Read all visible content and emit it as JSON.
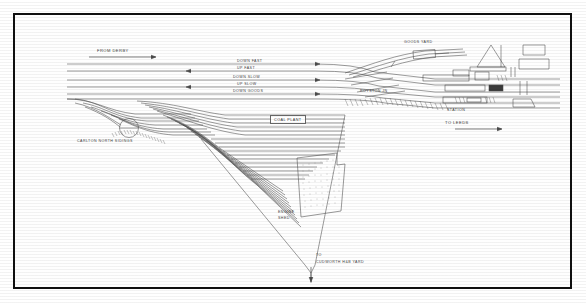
{
  "diagram": {
    "frame_color": "#101010",
    "ink_color": "#4a4a4a",
    "paper_color": "#fefefe"
  },
  "main_lines": [
    {
      "id": "down-fast",
      "label": "DOWN FAST",
      "direction": "right",
      "y": 62
    },
    {
      "id": "up-fast",
      "label": "UP FAST",
      "direction": "left",
      "y": 69
    },
    {
      "id": "down-slow",
      "label": "DOWN SLOW",
      "direction": "right",
      "y": 78
    },
    {
      "id": "up-slow",
      "label": "UP SLOW",
      "direction": "left",
      "y": 85
    },
    {
      "id": "down-goods",
      "label": "DOWN GOODS",
      "direction": "right",
      "y": 92
    }
  ],
  "destinations": [
    {
      "id": "from-derby",
      "label": "FROM DERBY",
      "arrow": "right"
    },
    {
      "id": "to-leeds",
      "label": "TO LEEDS",
      "arrow": "right"
    },
    {
      "id": "to-cudworth",
      "line1": "TO",
      "line2": "CUDWORTH H&B YARD",
      "arrow": "down"
    }
  ],
  "features": [
    {
      "id": "goods-yard",
      "label": "GOODS YARD"
    },
    {
      "id": "royston-junction",
      "label": "ROYSTON JN"
    },
    {
      "id": "station",
      "label": "STATION"
    },
    {
      "id": "coal-plant",
      "label": "COAL PLANT"
    },
    {
      "id": "engine-shed",
      "line1": "ENGINE",
      "line2": "SHED"
    },
    {
      "id": "carlton-north-sidings",
      "label": "CARLTON NORTH SIDINGS"
    }
  ]
}
